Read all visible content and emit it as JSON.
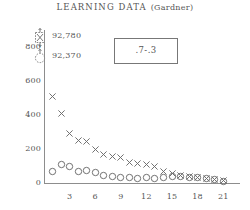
{
  "title": {
    "main": "LEARNING  DATA",
    "paren": "(Gardner)"
  },
  "legend": {
    "entries": [
      {
        "marker": "x-in-dashed-box-icon",
        "label": "92,780"
      },
      {
        "marker": "dashed-circle-icon",
        "label": "92,370"
      }
    ]
  },
  "annotation_box": {
    "label": ".7-.3"
  },
  "colors": {
    "axis": "#8d8d8d",
    "text": "#555555",
    "marker": "#6b6b6b",
    "box_border": "#777777"
  },
  "chart_data": {
    "type": "scatter",
    "title": "LEARNING DATA (Gardner)",
    "xlabel": "",
    "ylabel": "",
    "xlim": [
      0,
      22.5
    ],
    "ylim": [
      0,
      880
    ],
    "grid": false,
    "legend_position": "upper-left",
    "yticks": [
      0,
      200,
      400,
      600,
      800
    ],
    "ytick_labels": [
      "0",
      "200",
      "400",
      "600",
      "800"
    ],
    "xticks": [
      3,
      6,
      9,
      12,
      15,
      18,
      21
    ],
    "xtick_labels": [
      "3",
      "6",
      "9",
      "12",
      "15",
      "18",
      "21"
    ],
    "series": [
      {
        "name": "92,780",
        "marker": "x",
        "x": [
          1,
          2,
          3,
          4,
          5,
          6,
          7,
          8,
          9,
          10,
          11,
          12,
          13,
          14,
          15,
          16,
          17,
          18,
          19,
          20,
          21
        ],
        "y": [
          505,
          410,
          290,
          250,
          245,
          195,
          165,
          155,
          150,
          120,
          115,
          110,
          95,
          70,
          55,
          45,
          40,
          35,
          28,
          22,
          15
        ]
      },
      {
        "name": "92,370",
        "marker": "o",
        "x": [
          1,
          2,
          3,
          4,
          5,
          6,
          7,
          8,
          9,
          10,
          11,
          12,
          13,
          14,
          15,
          16,
          17,
          18,
          19,
          20,
          21
        ],
        "y": [
          70,
          110,
          95,
          65,
          75,
          60,
          45,
          40,
          35,
          30,
          25,
          30,
          25,
          35,
          40,
          40,
          35,
          32,
          25,
          20,
          10
        ]
      }
    ]
  }
}
